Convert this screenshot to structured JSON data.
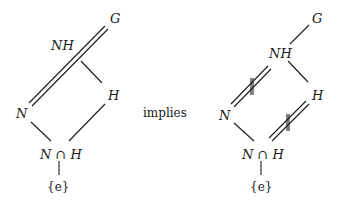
{
  "diagram": {
    "type": "subgroup-lattice",
    "connector_text": "implies",
    "left": {
      "nodes": {
        "G": "G",
        "NH": "NH",
        "H": "H",
        "N": "N",
        "NcapH": "N ∩ H",
        "e": "{e}"
      },
      "edges": [
        {
          "from": "N",
          "to": "G",
          "style": "double"
        },
        {
          "from": "NH",
          "to": "H",
          "style": "single"
        },
        {
          "from": "N",
          "to": "NcapH",
          "style": "single"
        },
        {
          "from": "H",
          "to": "NcapH",
          "style": "single"
        },
        {
          "from": "NcapH",
          "to": "e",
          "style": "single"
        }
      ]
    },
    "right": {
      "nodes": {
        "G": "G",
        "NH": "NH",
        "H": "H",
        "N": "N",
        "NcapH": "N ∩ H",
        "e": "{e}"
      },
      "edges": [
        {
          "from": "NH",
          "to": "G",
          "style": "single"
        },
        {
          "from": "N",
          "to": "NH",
          "style": "double-marked"
        },
        {
          "from": "NH",
          "to": "H",
          "style": "single"
        },
        {
          "from": "N",
          "to": "NcapH",
          "style": "single"
        },
        {
          "from": "NcapH",
          "to": "H",
          "style": "double-marked"
        },
        {
          "from": "NcapH",
          "to": "e",
          "style": "single"
        }
      ]
    }
  }
}
